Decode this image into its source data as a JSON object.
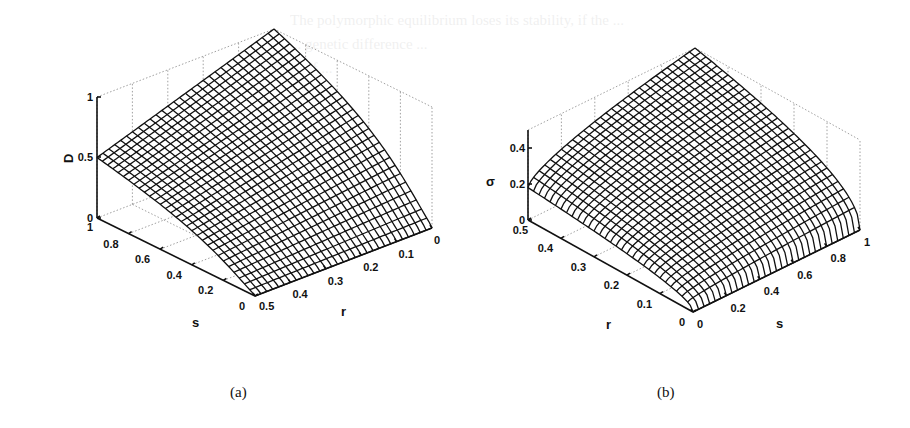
{
  "background_text": {
    "lines": [
      "The polymorphic equilibrium loses its stability, if the ...",
      "... genetic difference ...",
      "... of ..."
    ]
  },
  "figures": [
    {
      "id": "a",
      "caption": "(a)",
      "z_label": "D",
      "x_label": "s",
      "y_label": "r",
      "z_ticks": [
        "0",
        "0.5",
        "1"
      ],
      "s_ticks": [
        "1",
        "0.8",
        "0.6",
        "0.4",
        "0.2",
        "0"
      ],
      "r_ticks": [
        "0.5",
        "0.4",
        "0.3",
        "0.2",
        "0.1",
        "0"
      ]
    },
    {
      "id": "b",
      "caption": "(b)",
      "z_label": "σ",
      "x_label": "r",
      "y_label": "s",
      "z_ticks": [
        "0",
        "0.2",
        "0.4"
      ],
      "r_ticks": [
        "0.5",
        "0.4",
        "0.3",
        "0.2",
        "0.1",
        "0"
      ],
      "s_ticks": [
        "0",
        "0.2",
        "0.4",
        "0.6",
        "0.8",
        "1"
      ]
    }
  ],
  "chart_data": [
    {
      "type": "surface",
      "title": "(a)",
      "xlabel": "s",
      "ylabel": "r",
      "zlabel": "D",
      "x_range": [
        0,
        1
      ],
      "y_range": [
        0,
        0.5
      ],
      "z_range": [
        0,
        1
      ],
      "z_ticks": [
        0,
        0.5,
        1
      ],
      "x_ticks": [
        0,
        0.2,
        0.4,
        0.6,
        0.8,
        1
      ],
      "y_ticks": [
        0,
        0.1,
        0.2,
        0.3,
        0.4,
        0.5
      ],
      "grid": true,
      "mesh": "wireframe ~30x30",
      "corner_values": [
        {
          "s": 1,
          "r": 0.5,
          "D": 0.5
        },
        {
          "s": 1,
          "r": 0,
          "D": 1.0
        },
        {
          "s": 0,
          "r": 0.5,
          "D": 0.0
        },
        {
          "s": 0,
          "r": 0,
          "D": 0.1
        }
      ],
      "description": "D rises from 0 at s=0 toward 1 as r→0 and s→1; at s=1 D falls linearly from 1 (r=0) to 0.5 (r=0.5); sharp curved edge near r=0"
    },
    {
      "type": "surface",
      "title": "(b)",
      "xlabel": "r",
      "ylabel": "s",
      "zlabel": "σ",
      "x_range": [
        0,
        0.5
      ],
      "y_range": [
        0,
        1
      ],
      "z_range": [
        0,
        0.5
      ],
      "z_ticks": [
        0,
        0.2,
        0.4
      ],
      "x_ticks": [
        0,
        0.1,
        0.2,
        0.3,
        0.4,
        0.5
      ],
      "y_ticks": [
        0,
        0.2,
        0.4,
        0.6,
        0.8,
        1
      ],
      "grid": true,
      "mesh": "wireframe ~30x30",
      "corner_values": [
        {
          "r": 0.5,
          "s": 0,
          "sigma": 0.18
        },
        {
          "r": 0.5,
          "s": 1,
          "sigma": 0.5
        },
        {
          "r": 0,
          "s": 0,
          "sigma": 0.0
        },
        {
          "r": 0,
          "s": 1,
          "sigma": 0.2
        }
      ],
      "description": "σ increases with both r and s, concave surface; max ≈0.5 at r=0.5, s=1"
    }
  ]
}
